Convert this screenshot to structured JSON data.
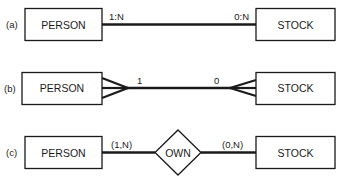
{
  "diagram": {
    "type": "er-notation-comparison",
    "rows": [
      {
        "label": "(a)",
        "left_entity": "PERSON",
        "right_entity": "STOCK",
        "left_cardinality": "1:N",
        "right_cardinality": "0:N",
        "notation": "ratio-labels"
      },
      {
        "label": "(b)",
        "left_entity": "PERSON",
        "right_entity": "STOCK",
        "left_cardinality": "1",
        "right_cardinality": "0",
        "notation": "crows-foot"
      },
      {
        "label": "(c)",
        "left_entity": "PERSON",
        "right_entity": "STOCK",
        "relationship": "OWN",
        "left_cardinality": "(1,N)",
        "right_cardinality": "(0,N)",
        "notation": "min-max-diamond"
      }
    ],
    "colors": {
      "stroke": "#1a1a1a",
      "background": "#ffffff"
    }
  }
}
